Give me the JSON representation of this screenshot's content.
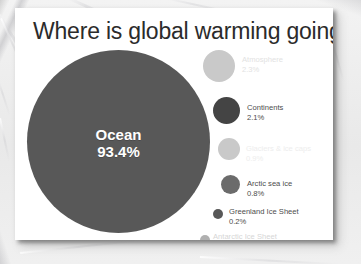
{
  "slide": {
    "title": "Where is global warming going?",
    "background_color": "#ffffff",
    "title_color": "#2b2b2b"
  },
  "chart_data": {
    "type": "pie",
    "title": "Where is global warming going?",
    "xlabel": "",
    "ylabel": "",
    "units": "percent of total heat uptake",
    "render_style": "proportional-area-bubbles",
    "legend": "right",
    "grid": false,
    "categories": [
      "Ocean",
      "Atmosphere",
      "Continents",
      "Glaciers & ice caps",
      "Arctic sea ice",
      "Greenland Ice Sheet",
      "Antarctic Ice Sheet"
    ],
    "values": [
      93.4,
      2.3,
      2.1,
      0.9,
      0.8,
      0.2,
      0.2
    ],
    "value_labels": [
      "93.4%",
      "2.3%",
      "2.1%",
      "0.9%",
      "0.8%",
      "0.2%",
      "0.2%"
    ],
    "colors": [
      "#585858",
      "#c9c9c9",
      "#444444",
      "#c9c9c9",
      "#6b6b6b",
      "#585858",
      "#b0b0b0"
    ],
    "series": [
      {
        "name": "Share of global warming heat",
        "values": [
          93.4,
          2.3,
          2.1,
          0.9,
          0.8,
          0.2,
          0.2
        ]
      }
    ]
  },
  "ocean": {
    "name": "Ocean",
    "pct": "93.4%",
    "color": "#585858",
    "text_color": "#ffffff"
  },
  "legend": {
    "items": [
      {
        "name": "Atmosphere",
        "pct": "2.3%",
        "dot_color": "#c9c9c9",
        "text_color": "#e2e2e2"
      },
      {
        "name": "Continents",
        "pct": "2.1%",
        "dot_color": "#444444",
        "text_color": "#4c4c4c"
      },
      {
        "name": "Glaciers & ice caps",
        "pct": "0.9%",
        "dot_color": "#c9c9c9",
        "text_color": "#ededed"
      },
      {
        "name": "Arctic sea ice",
        "pct": "0.8%",
        "dot_color": "#6b6b6b",
        "text_color": "#4c4c4c"
      },
      {
        "name": "Greenland Ice Sheet",
        "pct": "0.2%",
        "dot_color": "#585858",
        "text_color": "#4c4c4c"
      },
      {
        "name": "Antarctic Ice Sheet",
        "pct": "0.2%",
        "dot_color": "#b0b0b0",
        "text_color": "#d6d6d6"
      }
    ]
  }
}
